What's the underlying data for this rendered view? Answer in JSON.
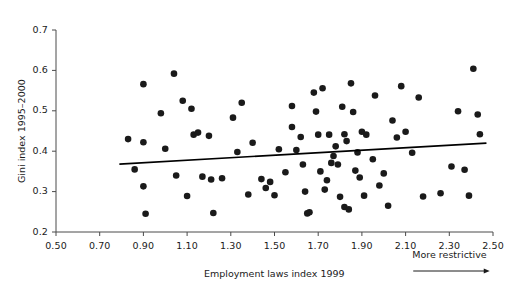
{
  "chart_data": {
    "type": "scatter",
    "title": "",
    "xlabel": "Employment laws index 1999",
    "ylabel": "Gini index 1995–2000",
    "xlim": [
      0.5,
      2.5
    ],
    "ylim": [
      0.2,
      0.7
    ],
    "xticks": [
      "0.50",
      "0.70",
      "0.90",
      "1.10",
      "1.30",
      "1.50",
      "1.70",
      "1.90",
      "2.10",
      "2.30",
      "2.50"
    ],
    "xtick_values": [
      0.5,
      0.7,
      0.9,
      1.1,
      1.3,
      1.5,
      1.7,
      1.9,
      2.1,
      2.3,
      2.5
    ],
    "yticks": [
      "0.2",
      "0.3",
      "0.4",
      "0.5",
      "0.6",
      "0.7"
    ],
    "ytick_values": [
      0.2,
      0.3,
      0.4,
      0.5,
      0.6,
      0.7
    ],
    "grid": false,
    "legend": null,
    "annotations": [
      {
        "text": "More restrictive",
        "x": 2.3,
        "y": 0.155,
        "arrow": "right"
      }
    ],
    "marker": {
      "shape": "circle",
      "color": "#1a1a1a",
      "size": 3.3
    },
    "trendline": {
      "type": "linear-fit",
      "color": "#000000",
      "width": 1.6,
      "x_start": 0.79,
      "y_start": 0.368,
      "x_end": 2.47,
      "y_end": 0.42
    },
    "points": [
      [
        0.83,
        0.43
      ],
      [
        0.86,
        0.355
      ],
      [
        0.9,
        0.566
      ],
      [
        0.9,
        0.422
      ],
      [
        0.9,
        0.313
      ],
      [
        0.91,
        0.245
      ],
      [
        0.98,
        0.494
      ],
      [
        1.0,
        0.406
      ],
      [
        1.04,
        0.592
      ],
      [
        1.05,
        0.34
      ],
      [
        1.08,
        0.525
      ],
      [
        1.1,
        0.289
      ],
      [
        1.12,
        0.505
      ],
      [
        1.13,
        0.441
      ],
      [
        1.15,
        0.446
      ],
      [
        1.17,
        0.337
      ],
      [
        1.2,
        0.438
      ],
      [
        1.21,
        0.33
      ],
      [
        1.22,
        0.247
      ],
      [
        1.26,
        0.333
      ],
      [
        1.31,
        0.483
      ],
      [
        1.33,
        0.398
      ],
      [
        1.35,
        0.52
      ],
      [
        1.38,
        0.293
      ],
      [
        1.4,
        0.421
      ],
      [
        1.44,
        0.331
      ],
      [
        1.46,
        0.309
      ],
      [
        1.48,
        0.324
      ],
      [
        1.5,
        0.291
      ],
      [
        1.52,
        0.405
      ],
      [
        1.55,
        0.348
      ],
      [
        1.58,
        0.46
      ],
      [
        1.58,
        0.512
      ],
      [
        1.6,
        0.403
      ],
      [
        1.62,
        0.435
      ],
      [
        1.63,
        0.367
      ],
      [
        1.64,
        0.3
      ],
      [
        1.65,
        0.246
      ],
      [
        1.66,
        0.249
      ],
      [
        1.68,
        0.545
      ],
      [
        1.69,
        0.498
      ],
      [
        1.7,
        0.441
      ],
      [
        1.71,
        0.35
      ],
      [
        1.72,
        0.556
      ],
      [
        1.73,
        0.305
      ],
      [
        1.74,
        0.328
      ],
      [
        1.75,
        0.441
      ],
      [
        1.76,
        0.371
      ],
      [
        1.77,
        0.388
      ],
      [
        1.78,
        0.412
      ],
      [
        1.79,
        0.367
      ],
      [
        1.8,
        0.287
      ],
      [
        1.81,
        0.51
      ],
      [
        1.82,
        0.442
      ],
      [
        1.82,
        0.262
      ],
      [
        1.83,
        0.425
      ],
      [
        1.84,
        0.256
      ],
      [
        1.85,
        0.568
      ],
      [
        1.86,
        0.497
      ],
      [
        1.87,
        0.352
      ],
      [
        1.88,
        0.397
      ],
      [
        1.89,
        0.335
      ],
      [
        1.9,
        0.448
      ],
      [
        1.91,
        0.29
      ],
      [
        1.92,
        0.441
      ],
      [
        1.95,
        0.38
      ],
      [
        1.96,
        0.538
      ],
      [
        1.98,
        0.315
      ],
      [
        2.0,
        0.345
      ],
      [
        2.02,
        0.265
      ],
      [
        2.04,
        0.476
      ],
      [
        2.06,
        0.434
      ],
      [
        2.08,
        0.561
      ],
      [
        2.1,
        0.448
      ],
      [
        2.13,
        0.396
      ],
      [
        2.16,
        0.533
      ],
      [
        2.18,
        0.288
      ],
      [
        2.26,
        0.296
      ],
      [
        2.31,
        0.362
      ],
      [
        2.34,
        0.499
      ],
      [
        2.37,
        0.354
      ],
      [
        2.39,
        0.29
      ],
      [
        2.41,
        0.604
      ],
      [
        2.43,
        0.491
      ],
      [
        2.44,
        0.442
      ]
    ]
  }
}
